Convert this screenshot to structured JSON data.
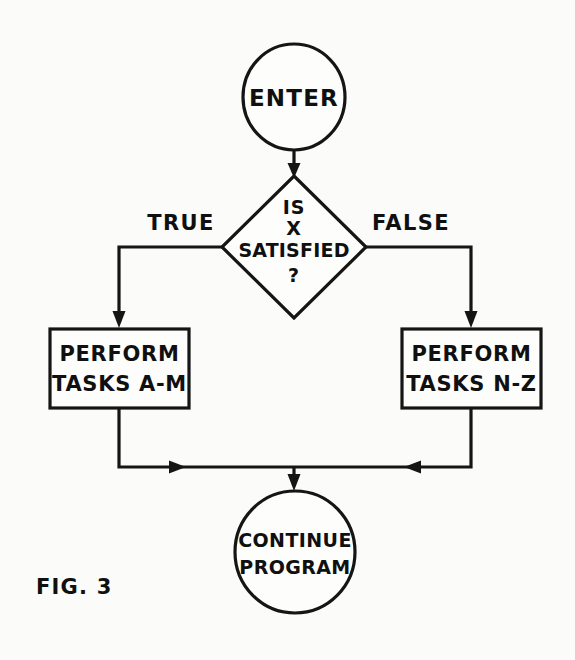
{
  "figure": {
    "caption": "FIG. 3",
    "ink_color": "#151515",
    "background_color": "#fbfbf9"
  },
  "nodes": {
    "start": {
      "type": "terminator",
      "shape": "circle",
      "label": "ENTER"
    },
    "decision": {
      "type": "decision",
      "shape": "diamond",
      "line1": "IS",
      "line2": "X",
      "line3": "SATISFIED",
      "line4": "?"
    },
    "process_left": {
      "type": "process",
      "shape": "rectangle",
      "line1": "PERFORM",
      "line2": "TASKS A-M"
    },
    "process_right": {
      "type": "process",
      "shape": "rectangle",
      "line1": "PERFORM",
      "line2": "TASKS N-Z"
    },
    "end": {
      "type": "terminator",
      "shape": "circle",
      "line1": "CONTINUE",
      "line2": "PROGRAM"
    }
  },
  "edges": {
    "start_to_decision": {
      "label": ""
    },
    "decision_true": {
      "label": "TRUE"
    },
    "decision_false": {
      "label": "FALSE"
    },
    "left_to_merge": {
      "label": ""
    },
    "right_to_merge": {
      "label": ""
    },
    "merge_to_end": {
      "label": ""
    }
  }
}
